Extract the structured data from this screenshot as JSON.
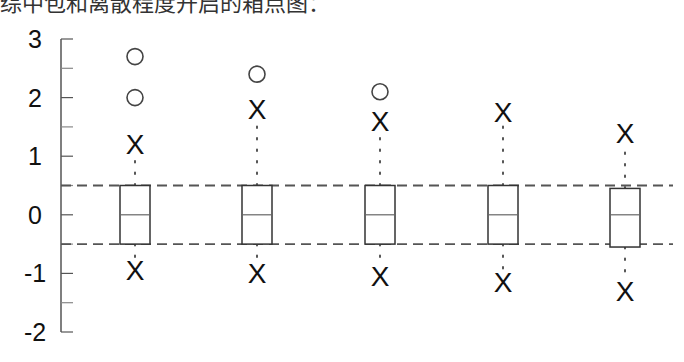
{
  "caption": "综中包和离散程度开启的箱点图：",
  "chart_data": {
    "type": "box",
    "title": "",
    "xlabel": "",
    "ylabel": "",
    "ylim": [
      -2,
      3
    ],
    "yticks_major": [
      3,
      2,
      1,
      0,
      -1,
      -2
    ],
    "ytick_labels": [
      "3",
      "2",
      "1",
      "0",
      "-1",
      "-2"
    ],
    "ytick_minor_step": 0.5,
    "grid": false,
    "reference_lines": [
      0.5,
      -0.5
    ],
    "reference_line_style": "dashed",
    "whisker_end_marker": "x",
    "outlier_marker": "circle",
    "series": [
      {
        "name": "box-1",
        "q1": -0.5,
        "median": 0,
        "q3": 0.5,
        "whisker_high": 1.2,
        "whisker_low": -0.95,
        "outliers": [
          2.0,
          2.7
        ]
      },
      {
        "name": "box-2",
        "q1": -0.5,
        "median": 0,
        "q3": 0.5,
        "whisker_high": 1.8,
        "whisker_low": -1.0,
        "outliers": [
          2.4
        ]
      },
      {
        "name": "box-3",
        "q1": -0.5,
        "median": 0,
        "q3": 0.5,
        "whisker_high": 1.6,
        "whisker_low": -1.05,
        "outliers": [
          2.1
        ]
      },
      {
        "name": "box-4",
        "q1": -0.5,
        "median": 0,
        "q3": 0.5,
        "whisker_high": 1.75,
        "whisker_low": -1.15,
        "outliers": []
      },
      {
        "name": "box-5",
        "q1": -0.55,
        "median": 0,
        "q3": 0.45,
        "whisker_high": 1.4,
        "whisker_low": -1.3,
        "outliers": []
      }
    ]
  }
}
